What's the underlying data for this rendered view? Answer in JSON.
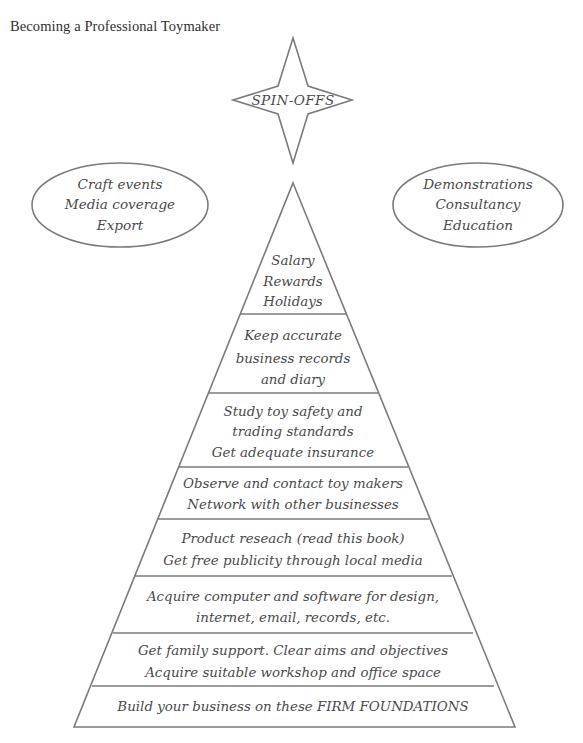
{
  "page": {
    "title": "Becoming a Professional Toymaker",
    "background_color": "#ffffff",
    "stroke_color": "#7b7b7b",
    "text_color": "#4a4a4a"
  },
  "star": {
    "name": "spin-offs-star",
    "label": "SPIN-OFFS"
  },
  "bubbles": [
    {
      "name": "left-ellipse",
      "lines": [
        "Craft events",
        "Media coverage",
        "Export"
      ]
    },
    {
      "name": "right-ellipse",
      "lines": [
        "Demonstrations",
        "Consultancy",
        "Education"
      ]
    }
  ],
  "pyramid": {
    "name": "firm-foundations-pyramid",
    "tiers": [
      {
        "level": 1,
        "lines": [
          "Salary",
          "Rewards",
          "Holidays"
        ]
      },
      {
        "level": 2,
        "lines": [
          "Keep accurate",
          "business records",
          "and diary"
        ]
      },
      {
        "level": 3,
        "lines": [
          "Study toy safety and",
          "trading standards",
          "Get adequate insurance"
        ]
      },
      {
        "level": 4,
        "lines": [
          "Observe and contact toy makers",
          "Network with other businesses"
        ]
      },
      {
        "level": 5,
        "lines": [
          "Product reseach (read this book)",
          "Get free publicity through local media"
        ]
      },
      {
        "level": 6,
        "lines": [
          "Acquire computer and software for design,",
          "internet, email, records, etc."
        ]
      },
      {
        "level": 7,
        "lines": [
          "Get family support. Clear aims and objectives",
          "Acquire suitable workshop and office space"
        ]
      },
      {
        "level": 8,
        "lines": [
          "Build your business on these FIRM FOUNDATIONS"
        ]
      }
    ]
  }
}
